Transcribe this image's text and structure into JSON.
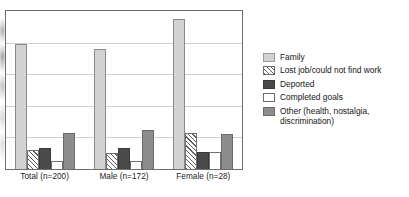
{
  "chart_data": {
    "type": "bar",
    "title": "",
    "subtitle": "",
    "xlabel": "",
    "ylabel": "",
    "ylim": [
      0,
      100
    ],
    "grid": true,
    "gridlines": [
      20,
      40,
      60,
      80
    ],
    "legend_position": "right",
    "categories": [
      "Total (n=200)",
      "Male (n=172)",
      "Female (n=28)"
    ],
    "series": [
      {
        "name": "Family",
        "color": "#d2d2d2",
        "pattern": "solid",
        "values": [
          79,
          76,
          95
        ]
      },
      {
        "name": "Lost job/could not find work",
        "color": "#ffffff",
        "pattern": "diagonal-hatch",
        "values": [
          12,
          10,
          23
        ]
      },
      {
        "name": "Deported",
        "color": "#4a4a4a",
        "pattern": "solid",
        "values": [
          13,
          13,
          11
        ]
      },
      {
        "name": "Completed goals",
        "color": "#ffffff",
        "pattern": "solid",
        "values": [
          5,
          5,
          11
        ]
      },
      {
        "name": "Other (health, nostalgia,\ndiscrimination)",
        "color": "#8d8d8d",
        "pattern": "solid",
        "values": [
          23,
          25,
          22
        ]
      }
    ]
  },
  "legend": {
    "items": [
      {
        "label": "Family",
        "swatch": "legend-swatch-family"
      },
      {
        "label": "Lost job/could not find work",
        "swatch": "legend-swatch-lost-job"
      },
      {
        "label": "Deported",
        "swatch": "legend-swatch-deported"
      },
      {
        "label": "Completed goals",
        "swatch": "legend-swatch-completed-goals"
      },
      {
        "label": "Other (health, nostalgia,\ndiscrimination)",
        "swatch": "legend-swatch-other"
      }
    ]
  }
}
